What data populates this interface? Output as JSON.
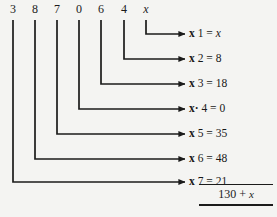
{
  "diagram": {
    "type": "long-multiplication-distribution",
    "top_row": {
      "label": "multiplicand-digits",
      "digits": [
        {
          "text": "3",
          "italic": false,
          "x": 13
        },
        {
          "text": "8",
          "italic": false,
          "x": 35
        },
        {
          "text": "7",
          "italic": false,
          "x": 57
        },
        {
          "text": "0",
          "italic": false,
          "x": 79
        },
        {
          "text": "6",
          "italic": false,
          "x": 101
        },
        {
          "text": "4",
          "italic": false,
          "x": 124
        },
        {
          "text": "x",
          "italic": true,
          "x": 146
        }
      ]
    },
    "branches": [
      {
        "source_digit": "x",
        "source_x": 146,
        "row_y": 34,
        "operator": "x",
        "multiplier": "1",
        "result": "x",
        "result_italic": true,
        "label": "x 1 = x"
      },
      {
        "source_digit": "4",
        "source_x": 124,
        "row_y": 59,
        "operator": "x",
        "multiplier": "2",
        "result": "8",
        "result_italic": false,
        "label": "x 2 = 8"
      },
      {
        "source_digit": "6",
        "source_x": 101,
        "row_y": 84,
        "operator": "x",
        "multiplier": "3",
        "result": "18",
        "result_italic": false,
        "label": "x 3 = 18"
      },
      {
        "source_digit": "0",
        "source_x": 79,
        "row_y": 109,
        "operator": "x·",
        "multiplier": "4",
        "result": "0",
        "result_italic": false,
        "label": "x·4 = 0"
      },
      {
        "source_digit": "7",
        "source_x": 57,
        "row_y": 134,
        "operator": "x",
        "multiplier": "5",
        "result": "35",
        "result_italic": false,
        "label": "x 5 = 35"
      },
      {
        "source_digit": "8",
        "source_x": 35,
        "row_y": 159,
        "operator": "x",
        "multiplier": "6",
        "result": "48",
        "result_italic": false,
        "label": "x 6 = 48"
      },
      {
        "source_digit": "3",
        "source_x": 13,
        "row_y": 182,
        "operator": "x",
        "multiplier": "7",
        "result": "21",
        "result_italic": false,
        "label": "x 7 = 21"
      }
    ],
    "sum": {
      "prefix": "130 + ",
      "variable": "x",
      "full_text": "130 + x"
    },
    "colors": {
      "ink": "#1b1b1b",
      "background": "#f4f4f2"
    },
    "geometry": {
      "arrow_tip_x": 185,
      "digits_baseline_y": 14,
      "wire_start_y": 20
    }
  }
}
